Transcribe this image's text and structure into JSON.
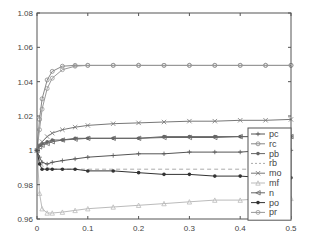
{
  "chart_data": {
    "type": "line",
    "title": "",
    "xlabel": "",
    "ylabel": "",
    "xlim": [
      0,
      0.5
    ],
    "ylim": [
      0.96,
      1.08
    ],
    "grid": false,
    "legend_position": "lower right (inside)",
    "x_ticks": [
      "0",
      "0.1",
      "0.2",
      "0.3",
      "0.4",
      "0.5"
    ],
    "y_ticks": [
      "0.96",
      "0.98",
      "1",
      "1.02",
      "1.04",
      "1.06",
      "1.08"
    ],
    "x": [
      0,
      0.005,
      0.01,
      0.02,
      0.03,
      0.05,
      0.075,
      0.1,
      0.15,
      0.2,
      0.25,
      0.3,
      0.35,
      0.4,
      0.45,
      0.5
    ],
    "series": [
      {
        "name": "pc",
        "marker": "+",
        "color": "#555555",
        "dash": "solid",
        "values": [
          1.0,
          0.996,
          0.993,
          0.992,
          0.993,
          0.994,
          0.995,
          0.996,
          0.997,
          0.998,
          0.998,
          0.999,
          0.999,
          0.999,
          1.0,
          1.0
        ]
      },
      {
        "name": "rc",
        "marker": "o",
        "color": "#888888",
        "dash": "solid",
        "values": [
          1.0,
          1.018,
          1.03,
          1.041,
          1.046,
          1.049,
          1.0495,
          1.0495,
          1.0495,
          1.0495,
          1.0495,
          1.0495,
          1.0495,
          1.0495,
          1.0495,
          1.0495
        ]
      },
      {
        "name": "pb",
        "marker": "*",
        "color": "#666666",
        "dash": "solid",
        "values": [
          1.0,
          1.003,
          1.004,
          1.005,
          1.006,
          1.006,
          1.007,
          1.007,
          1.007,
          1.007,
          1.008,
          1.008,
          1.008,
          1.008,
          1.008,
          1.008
        ]
      },
      {
        "name": "rb",
        "marker": "none",
        "color": "#aaaaaa",
        "dash": "dashed",
        "values": [
          1.0,
          0.994,
          0.991,
          0.99,
          0.989,
          0.989,
          0.989,
          0.989,
          0.989,
          0.989,
          0.989,
          0.989,
          0.989,
          0.989,
          0.989,
          0.989
        ]
      },
      {
        "name": "mo",
        "marker": "x",
        "color": "#777777",
        "dash": "solid",
        "values": [
          1.0,
          1.003,
          1.005,
          1.008,
          1.01,
          1.012,
          1.0135,
          1.0145,
          1.0155,
          1.016,
          1.0165,
          1.017,
          1.017,
          1.0175,
          1.0175,
          1.018
        ]
      },
      {
        "name": "mf",
        "marker": "^",
        "color": "#bbbbbb",
        "dash": "solid",
        "values": [
          1.0,
          0.975,
          0.966,
          0.9635,
          0.9635,
          0.964,
          0.965,
          0.966,
          0.967,
          0.968,
          0.969,
          0.97,
          0.971,
          0.971,
          0.972,
          0.972
        ]
      },
      {
        "name": "n",
        "marker": "<",
        "color": "#666666",
        "dash": "solid",
        "values": [
          1.0,
          1.002,
          1.003,
          1.004,
          1.005,
          1.006,
          1.0065,
          1.007,
          1.007,
          1.007,
          1.0075,
          1.0075,
          1.0075,
          1.008,
          1.008,
          1.008
        ]
      },
      {
        "name": "po",
        "marker": "*",
        "color": "#333333",
        "dash": "solid",
        "values": [
          1.0,
          0.992,
          0.989,
          0.989,
          0.989,
          0.989,
          0.989,
          0.988,
          0.988,
          0.987,
          0.986,
          0.986,
          0.985,
          0.985,
          0.984,
          0.984
        ]
      },
      {
        "name": "pr",
        "marker": "o",
        "color": "#999999",
        "dash": "solid",
        "values": [
          1.0,
          1.012,
          1.024,
          1.036,
          1.042,
          1.047,
          1.049,
          1.0495,
          1.0495,
          1.0495,
          1.0495,
          1.0495,
          1.0495,
          1.0495,
          1.0495,
          1.0495
        ]
      }
    ]
  }
}
